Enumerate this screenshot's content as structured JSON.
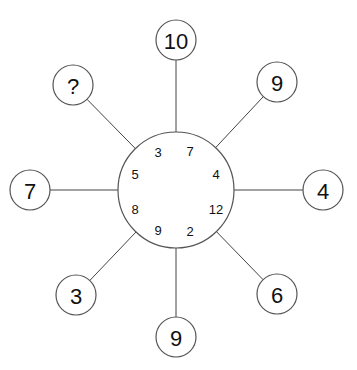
{
  "puzzle": {
    "center": {
      "x": 176,
      "y": 190,
      "r": 58
    },
    "outer": [
      {
        "id": "top",
        "label": "10",
        "x": 176,
        "y": 40
      },
      {
        "id": "top-right",
        "label": "9",
        "x": 277,
        "y": 82
      },
      {
        "id": "right",
        "label": "4",
        "x": 323,
        "y": 190
      },
      {
        "id": "bottom-right",
        "label": "6",
        "x": 277,
        "y": 294
      },
      {
        "id": "bottom",
        "label": "9",
        "x": 176,
        "y": 337
      },
      {
        "id": "bottom-left",
        "label": "3",
        "x": 76,
        "y": 295
      },
      {
        "id": "left",
        "label": "7",
        "x": 30,
        "y": 190
      },
      {
        "id": "top-left",
        "label": "?",
        "x": 73,
        "y": 85
      }
    ],
    "inner": [
      {
        "id": "top-left-upper",
        "label": "3",
        "x": 158,
        "y": 152
      },
      {
        "id": "top-right-upper",
        "label": "7",
        "x": 190,
        "y": 151
      },
      {
        "id": "right-upper",
        "label": "4",
        "x": 216,
        "y": 174
      },
      {
        "id": "right-lower",
        "label": "12",
        "x": 216,
        "y": 209
      },
      {
        "id": "bottom-right-lower",
        "label": "2",
        "x": 190,
        "y": 231
      },
      {
        "id": "bottom-left-lower",
        "label": "9",
        "x": 158,
        "y": 230
      },
      {
        "id": "left-lower",
        "label": "8",
        "x": 135,
        "y": 209
      },
      {
        "id": "left-upper",
        "label": "5",
        "x": 135,
        "y": 174
      }
    ]
  }
}
